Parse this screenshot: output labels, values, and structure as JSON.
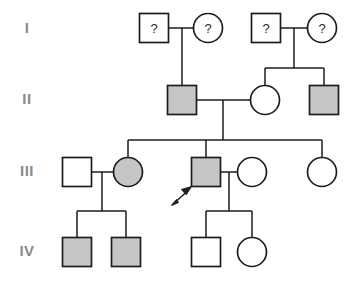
{
  "figure": {
    "kind": "pedigree-chart",
    "title": "",
    "background_color": "#ffffff",
    "line_color": "#1d1d1d",
    "affected_fill": "#c6c6c6",
    "unaffected_fill": "#ffffff",
    "label_color": "#8a8a8a"
  },
  "generation_labels": [
    {
      "id": "gen-I",
      "text": "I",
      "x": 27,
      "y": 29
    },
    {
      "id": "gen-II",
      "text": "II",
      "x": 27,
      "y": 100
    },
    {
      "id": "gen-III",
      "text": "III",
      "x": 27,
      "y": 172
    },
    {
      "id": "gen-IV",
      "text": "IV",
      "x": 27,
      "y": 252
    }
  ],
  "individuals": [
    {
      "id": "I-1",
      "generation": "I",
      "sex": "male",
      "shape": "square",
      "affected": false,
      "unknown_status": true,
      "label": "?",
      "cx": 154,
      "cy": 28
    },
    {
      "id": "I-2",
      "generation": "I",
      "sex": "female",
      "shape": "circle",
      "affected": false,
      "unknown_status": true,
      "label": "?",
      "cx": 208,
      "cy": 28
    },
    {
      "id": "I-3",
      "generation": "I",
      "sex": "male",
      "shape": "square",
      "affected": false,
      "unknown_status": true,
      "label": "?",
      "cx": 266,
      "cy": 28
    },
    {
      "id": "I-4",
      "generation": "I",
      "sex": "female",
      "shape": "circle",
      "affected": false,
      "unknown_status": true,
      "label": "?",
      "cx": 322,
      "cy": 28
    },
    {
      "id": "II-1",
      "generation": "II",
      "sex": "male",
      "shape": "square",
      "affected": true,
      "unknown_status": false,
      "label": "",
      "cx": 182,
      "cy": 100
    },
    {
      "id": "II-2",
      "generation": "II",
      "sex": "female",
      "shape": "circle",
      "affected": false,
      "unknown_status": false,
      "label": "",
      "cx": 265,
      "cy": 100
    },
    {
      "id": "II-3",
      "generation": "II",
      "sex": "male",
      "shape": "square",
      "affected": true,
      "unknown_status": false,
      "label": "",
      "cx": 324,
      "cy": 100
    },
    {
      "id": "III-1",
      "generation": "III",
      "sex": "male",
      "shape": "square",
      "affected": false,
      "unknown_status": false,
      "label": "",
      "cx": 77,
      "cy": 172
    },
    {
      "id": "III-2",
      "generation": "III",
      "sex": "female",
      "shape": "circle",
      "affected": true,
      "unknown_status": false,
      "label": "",
      "cx": 128,
      "cy": 172
    },
    {
      "id": "III-3",
      "generation": "III",
      "sex": "male",
      "shape": "square",
      "affected": true,
      "unknown_status": false,
      "label": "",
      "cx": 206,
      "cy": 172,
      "proband": true
    },
    {
      "id": "III-4",
      "generation": "III",
      "sex": "female",
      "shape": "circle",
      "affected": false,
      "unknown_status": false,
      "label": "",
      "cx": 252,
      "cy": 172
    },
    {
      "id": "III-5",
      "generation": "III",
      "sex": "female",
      "shape": "circle",
      "affected": false,
      "unknown_status": false,
      "label": "",
      "cx": 322,
      "cy": 172
    },
    {
      "id": "IV-1",
      "generation": "IV",
      "sex": "male",
      "shape": "square",
      "affected": true,
      "unknown_status": false,
      "label": "",
      "cx": 77,
      "cy": 252
    },
    {
      "id": "IV-2",
      "generation": "IV",
      "sex": "male",
      "shape": "square",
      "affected": true,
      "unknown_status": false,
      "label": "",
      "cx": 126,
      "cy": 252
    },
    {
      "id": "IV-3",
      "generation": "IV",
      "sex": "male",
      "shape": "square",
      "affected": false,
      "unknown_status": false,
      "label": "",
      "cx": 206,
      "cy": 252
    },
    {
      "id": "IV-4",
      "generation": "IV",
      "sex": "female",
      "shape": "circle",
      "affected": false,
      "unknown_status": false,
      "label": "",
      "cx": 252,
      "cy": 252
    }
  ],
  "matings": [
    {
      "id": "mating-I-1",
      "partners": [
        "I-1",
        "I-2"
      ],
      "children": [
        "II-1"
      ]
    },
    {
      "id": "mating-I-2",
      "partners": [
        "I-3",
        "I-4"
      ],
      "children": [
        "II-2",
        "II-3"
      ]
    },
    {
      "id": "mating-II-1",
      "partners": [
        "II-1",
        "II-2"
      ],
      "children": [
        "III-2",
        "III-3",
        "III-5"
      ]
    },
    {
      "id": "mating-III-1",
      "partners": [
        "III-1",
        "III-2"
      ],
      "children": [
        "IV-1",
        "IV-2"
      ]
    },
    {
      "id": "mating-III-2",
      "partners": [
        "III-3",
        "III-4"
      ],
      "children": [
        "IV-3",
        "IV-4"
      ]
    }
  ],
  "proband": {
    "id": "III-3",
    "marker": "arrow",
    "arrow_tip_x": 192,
    "arrow_tip_y": 187,
    "arrow_tail_x": 170,
    "arrow_tail_y": 206
  },
  "symbol_geometry": {
    "square_size": 29,
    "circle_radius": 14.5
  }
}
